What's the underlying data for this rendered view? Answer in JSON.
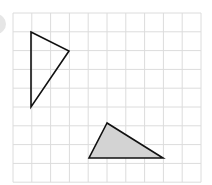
{
  "grid": {
    "x0": 13,
    "y0": 13,
    "cell": 18.8,
    "cols": 10,
    "rows": 9,
    "line_color": "#dcdcdc"
  },
  "shapes": [
    {
      "name": "triangle-outline",
      "points": [
        [
          31,
          32
        ],
        [
          69,
          51
        ],
        [
          31,
          107
        ]
      ],
      "fill": "none",
      "stroke": "#111111"
    },
    {
      "name": "triangle-shaded",
      "points": [
        [
          107,
          123
        ],
        [
          89,
          158
        ],
        [
          163,
          158
        ]
      ],
      "fill": "#d3d3d3",
      "stroke": "#111111"
    }
  ],
  "decor": {
    "circle_color": "#e6e6e6"
  }
}
